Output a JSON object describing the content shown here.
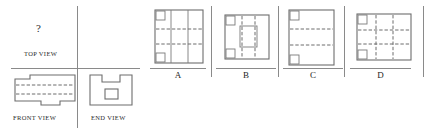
{
  "puzzle": {
    "type": "orthographic-projection-missing-view",
    "prompt_symbol": "?",
    "given_views": [
      {
        "id": "top",
        "label": "TOP VIEW",
        "content": "missing"
      },
      {
        "id": "front",
        "label": "FRONT VIEW",
        "content": "stepped-block-with-hidden-lines"
      },
      {
        "id": "end",
        "label": "END VIEW",
        "content": "u-channel-with-center-square"
      }
    ],
    "answer_options": [
      {
        "id": "A",
        "label": "A",
        "content": "rectangle-two-vertical-solid-dividers-two-horizontal-hidden-lines-two-corner-notches"
      },
      {
        "id": "B",
        "label": "B",
        "content": "square-central-rectangle-two-vertical-hidden-lines-two-corner-notches"
      },
      {
        "id": "C",
        "label": "C",
        "content": "tall-rectangle-two-horizontal-hidden-lines-two-corner-notches"
      },
      {
        "id": "D",
        "label": "D",
        "content": "rectangle-grid-of-hidden-lines-two-corner-notches"
      }
    ]
  },
  "colors": {
    "line": "#6d6d6d",
    "rule": "#8a8a8a",
    "text": "#2b2b2b",
    "background": "#ffffff"
  }
}
